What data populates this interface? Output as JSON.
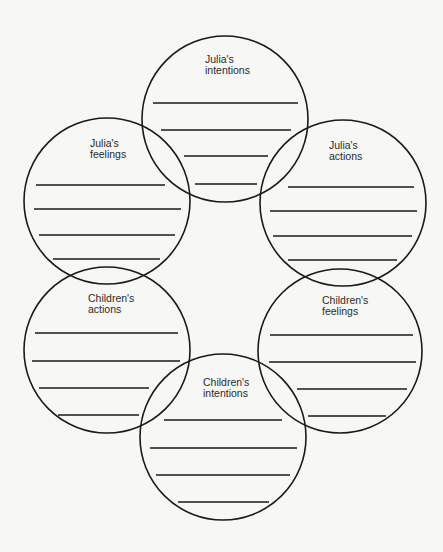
{
  "diagram": {
    "type": "overlapping-circles-worksheet",
    "stroke_color": "#1a1a1a",
    "background": "#f7f7f5",
    "circles": [
      {
        "id": "julia-intentions",
        "line1": "Julia's",
        "line2": "intentions",
        "cx": 225,
        "cy": 119,
        "r": 83,
        "label_x": 205,
        "label_y": 54,
        "lines": [
          [
            153,
            103,
            298
          ],
          [
            161,
            130,
            291
          ],
          [
            184,
            156,
            268
          ],
          [
            195,
            184,
            257
          ]
        ]
      },
      {
        "id": "julia-feelings",
        "line1": "Julia's",
        "line2": "feelings",
        "cx": 107,
        "cy": 201,
        "r": 83,
        "label_x": 90,
        "label_y": 138,
        "lines": [
          [
            36,
            185,
            165
          ],
          [
            34,
            209,
            181
          ],
          [
            39,
            235,
            175
          ],
          [
            53,
            259,
            160
          ]
        ]
      },
      {
        "id": "julia-actions",
        "line1": "Julia's",
        "line2": "actions",
        "cx": 343,
        "cy": 203,
        "r": 83,
        "label_x": 329,
        "label_y": 140,
        "lines": [
          [
            288,
            187,
            414
          ],
          [
            270,
            211,
            417
          ],
          [
            273,
            236,
            412
          ],
          [
            288,
            260,
            397
          ]
        ]
      },
      {
        "id": "children-actions",
        "line1": "Children's",
        "line2": "actions",
        "cx": 107,
        "cy": 350,
        "r": 83,
        "label_x": 88,
        "label_y": 293,
        "lines": [
          [
            35,
            333,
            178
          ],
          [
            32,
            361,
            180
          ],
          [
            39,
            388,
            149
          ],
          [
            58,
            415,
            139
          ]
        ]
      },
      {
        "id": "children-feelings",
        "line1": "Children's",
        "line2": "feelings",
        "cx": 340,
        "cy": 351,
        "r": 82,
        "label_x": 322,
        "label_y": 295,
        "lines": [
          [
            270,
            335,
            413
          ],
          [
            269,
            362,
            416
          ],
          [
            297,
            389,
            407
          ],
          [
            308,
            416,
            386
          ]
        ]
      },
      {
        "id": "children-intentions",
        "line1": "Children's",
        "line2": "intentions",
        "cx": 223,
        "cy": 437,
        "r": 83,
        "label_x": 203,
        "label_y": 377,
        "lines": [
          [
            164,
            420,
            282
          ],
          [
            150,
            448,
            297
          ],
          [
            156,
            475,
            290
          ],
          [
            178,
            502,
            269
          ]
        ]
      }
    ]
  }
}
